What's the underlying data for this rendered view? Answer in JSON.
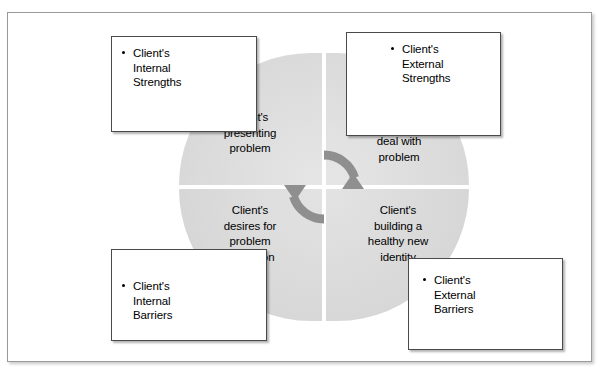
{
  "page": {
    "background_color": "#ffffff",
    "frame_border_color": "#9a9a9a"
  },
  "diagram": {
    "type": "quadrant-cycle",
    "center_icon": "circular-arrow-cycle-icon",
    "center_icon_color": "#909090",
    "quadrant_fill_color": "#dddddd",
    "quadrants": [
      {
        "position": "top-left",
        "label": "Client's\npresenting\nproblem",
        "lines": [
          "Client's",
          "presenting",
          "problem"
        ]
      },
      {
        "position": "top-right",
        "label": "Client's\nefforts to\ndeal with\nproblem",
        "lines": [
          "Client's",
          "efforts to",
          "deal with",
          "problem"
        ]
      },
      {
        "position": "bottom-left",
        "label": "Client's\ndesires for\nproblem\nresolution",
        "lines": [
          "Client's",
          "desires for",
          "problem",
          "resolution"
        ]
      },
      {
        "position": "bottom-right",
        "label": "Client's\nbuilding a\nhealthy new\nidentity",
        "lines": [
          "Client's",
          "building a",
          "healthy new",
          "identity"
        ]
      }
    ],
    "callouts": [
      {
        "position": "top-left",
        "bullet": "•",
        "label": "Client's\nInternal\nStrengths"
      },
      {
        "position": "top-right",
        "bullet": "•",
        "label": "Client's\nExternal\nStrengths"
      },
      {
        "position": "bottom-left",
        "bullet": "•",
        "label": "Client's\nInternal\nBarriers"
      },
      {
        "position": "bottom-right",
        "bullet": "•",
        "label": "Client's\nExternal\nBarriers"
      }
    ]
  }
}
